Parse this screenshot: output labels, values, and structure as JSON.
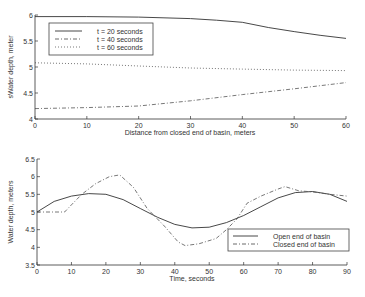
{
  "chart_data": [
    {
      "type": "line",
      "title": "",
      "xlabel": "Distance from closed end of basin, meters",
      "ylabel": "Water depth, meters",
      "ylabel_displayed": "sWater depth, meter",
      "xlim": [
        0,
        60
      ],
      "ylim": [
        4,
        6
      ],
      "xticks": [
        0,
        10,
        20,
        30,
        40,
        50,
        60
      ],
      "yticks": [
        4,
        4.5,
        5,
        5.5,
        6
      ],
      "ytick_labels": [
        "4",
        "4.5",
        "5",
        "5.5",
        "6"
      ],
      "grid": false,
      "legend_position": "upper left",
      "series": [
        {
          "name": "t = 20 seconds",
          "style": "solid",
          "x": [
            0,
            10,
            20,
            30,
            35,
            40,
            45,
            50,
            55,
            60
          ],
          "y": [
            5.97,
            5.97,
            5.96,
            5.93,
            5.9,
            5.86,
            5.76,
            5.68,
            5.61,
            5.55
          ]
        },
        {
          "name": "t = 40 seconds",
          "style": "dashdot",
          "x": [
            0,
            10,
            20,
            30,
            40,
            50,
            60
          ],
          "y": [
            4.2,
            4.22,
            4.25,
            4.35,
            4.47,
            4.58,
            4.7
          ]
        },
        {
          "name": "t = 60 seconds",
          "style": "dotted",
          "x": [
            0,
            10,
            20,
            30,
            40,
            50,
            60
          ],
          "y": [
            5.08,
            5.06,
            5.02,
            4.98,
            4.96,
            4.94,
            4.93
          ]
        }
      ]
    },
    {
      "type": "line",
      "title": "",
      "xlabel": "Time, seconds",
      "ylabel": "Water depth, meters",
      "xlim": [
        0,
        90
      ],
      "ylim": [
        3.5,
        6.5
      ],
      "xticks": [
        0,
        10,
        20,
        30,
        40,
        50,
        60,
        70,
        80,
        90
      ],
      "yticks": [
        3.5,
        4,
        4.5,
        5,
        5.5,
        6,
        6.5
      ],
      "ytick_labels": [
        "3.5",
        "4",
        "4.5",
        "5",
        "5.5",
        "6",
        "6.5"
      ],
      "grid": false,
      "legend_position": "lower right",
      "series": [
        {
          "name": "Open end of basin",
          "style": "solid",
          "x": [
            0,
            5,
            10,
            15,
            20,
            25,
            30,
            35,
            40,
            45,
            50,
            55,
            60,
            65,
            70,
            75,
            80,
            85,
            90
          ],
          "y": [
            5.0,
            5.3,
            5.45,
            5.52,
            5.5,
            5.35,
            5.1,
            4.85,
            4.65,
            4.55,
            4.57,
            4.7,
            4.9,
            5.15,
            5.4,
            5.55,
            5.58,
            5.5,
            5.3
          ]
        },
        {
          "name": "Closed end of basin",
          "style": "dashdot",
          "x": [
            0,
            5,
            8,
            10,
            13,
            17,
            21,
            24,
            28,
            32,
            37,
            41,
            43,
            47,
            52,
            55,
            58,
            61,
            65,
            70,
            72,
            76,
            80,
            85,
            90
          ],
          "y": [
            5.0,
            5.0,
            5.0,
            5.2,
            5.5,
            5.8,
            6.0,
            6.05,
            5.7,
            5.1,
            4.6,
            4.15,
            4.05,
            4.1,
            4.25,
            4.5,
            4.8,
            5.25,
            5.45,
            5.65,
            5.72,
            5.6,
            5.57,
            5.5,
            5.45
          ]
        }
      ]
    }
  ]
}
